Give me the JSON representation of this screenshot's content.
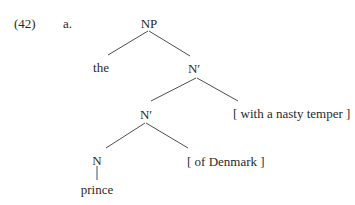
{
  "example": {
    "number": "(42)",
    "sub_label": "a."
  },
  "tree": {
    "root": "NP",
    "det": "the",
    "nbar_upper": "N′",
    "nbar_lower": "N′",
    "adjunct_upper": "[ with a nasty temper ]",
    "head": "N",
    "complement": "[ of Denmark ]",
    "terminal": "prince"
  }
}
